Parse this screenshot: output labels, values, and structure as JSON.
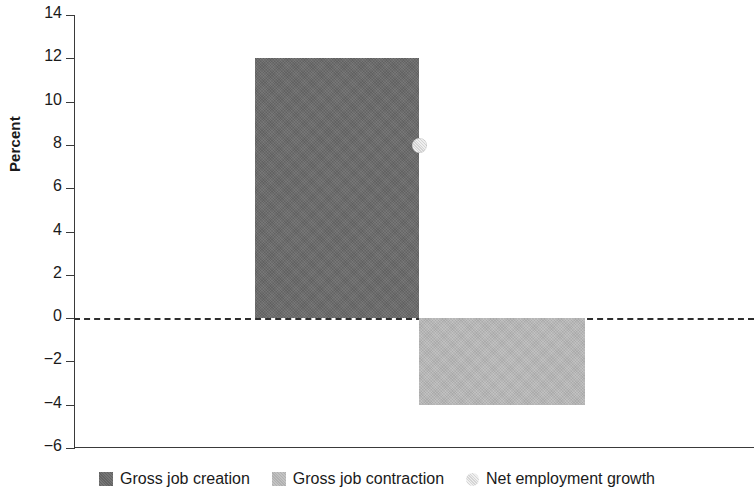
{
  "chart_data": {
    "type": "bar",
    "title": "",
    "subtitle": "",
    "xlabel": "",
    "ylabel": "Percent",
    "ylim": [
      -6,
      14
    ],
    "ytick_step": 2,
    "yticks": [
      "14",
      "12",
      "10",
      "8",
      "6",
      "4",
      "2",
      "0",
      "-2",
      "-4",
      "-6"
    ],
    "grid": false,
    "zero_reference_line": {
      "value": 0,
      "style": "dashed",
      "color": "#2e2e2e"
    },
    "categories": [
      ""
    ],
    "series": [
      {
        "name": "Gross job creation",
        "type": "bar",
        "values": [
          12.0
        ],
        "color": "#6b6b6b"
      },
      {
        "name": "Gross job contraction",
        "type": "bar",
        "values": [
          -4.0
        ],
        "color": "#b9b9b9"
      },
      {
        "name": "Net employment growth",
        "type": "scatter",
        "values": [
          8.0
        ],
        "color": "#dedede",
        "marker": "circle"
      }
    ],
    "legend_position": "bottom"
  },
  "axis": {
    "ylabel": "Percent",
    "ticks": [
      {
        "label": "14",
        "value": 14
      },
      {
        "label": "12",
        "value": 12
      },
      {
        "label": "10",
        "value": 10
      },
      {
        "label": "8",
        "value": 8
      },
      {
        "label": "6",
        "value": 6
      },
      {
        "label": "4",
        "value": 4
      },
      {
        "label": "2",
        "value": 2
      },
      {
        "label": "0",
        "value": 0
      },
      {
        "label": "−2",
        "value": -2
      },
      {
        "label": "−4",
        "value": -4
      },
      {
        "label": "−6",
        "value": -6
      }
    ]
  },
  "legend": {
    "items": [
      {
        "label": "Gross job creation",
        "swatch": "square-dark"
      },
      {
        "label": "Gross job contraction",
        "swatch": "square-light"
      },
      {
        "label": "Net employment growth",
        "swatch": "circle-light"
      }
    ]
  },
  "colors": {
    "bar_creation": "#6b6b6b",
    "bar_contraction": "#b9b9b9",
    "marker_net": "#dedede",
    "axis": "#3a3a3a",
    "text": "#1a1a1a",
    "background": "#ffffff"
  }
}
